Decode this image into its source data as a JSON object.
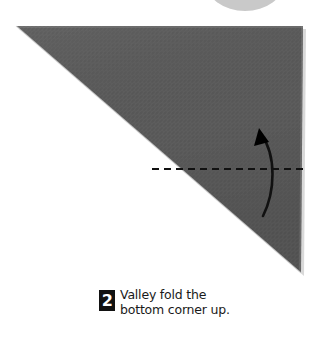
{
  "page": {
    "width": 321,
    "height": 340,
    "background_color": "#ffffff"
  },
  "instruction": {
    "step_number": "2",
    "line1": "Valley fold the",
    "line2": "bottom corner up.",
    "full_text": "Valley fold the bottom corner up.",
    "text_color": "#1a1a1a",
    "badge_background": "#121212",
    "badge_text_color": "#ffffff"
  },
  "illustration": {
    "type": "origami-step-diagram",
    "paper": {
      "shape": "right-triangle",
      "fill_color": "#5a5a5a",
      "edge_highlight_color": "#d8d8d8",
      "vertices": [
        {
          "x": 16,
          "y": 26
        },
        {
          "x": 303,
          "y": 26
        },
        {
          "x": 301,
          "y": 273
        }
      ]
    },
    "fold_line": {
      "style": "dashed",
      "label": "valley-fold-line",
      "color": "#111111",
      "x1": 152,
      "y1": 169,
      "x2": 308,
      "y2": 169,
      "dash_pattern": "7 5",
      "stroke_width": 2.2
    },
    "arrow": {
      "label": "fold-direction-arrow",
      "direction": "up",
      "color": "#111111",
      "curve": "bows-right",
      "tail": {
        "x": 263,
        "y": 216
      },
      "head": {
        "x": 259,
        "y": 131
      },
      "stroke_width": 2.6
    },
    "top_ellipse": {
      "label": "page-thumb-tab",
      "fill_color": "#c9c9c9",
      "cx": 245,
      "cy": -18,
      "rx": 39,
      "ry": 29
    }
  }
}
